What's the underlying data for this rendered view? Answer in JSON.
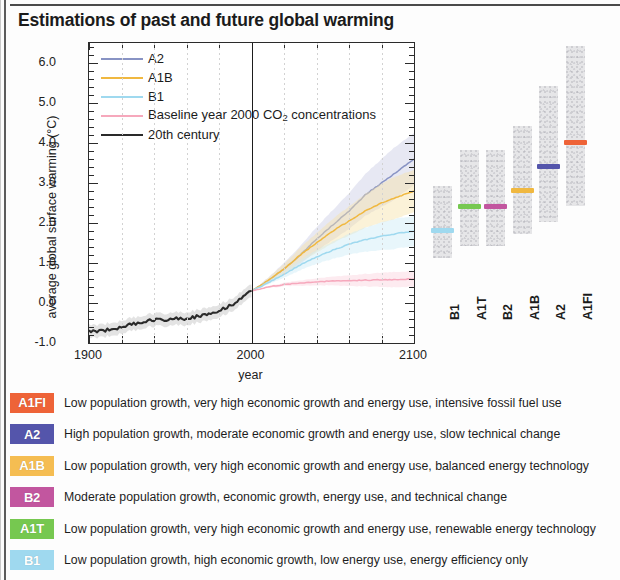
{
  "title": "Estimations of past and future global warming",
  "chart_data": {
    "type": "line",
    "title": "Estimations of past and future global warming",
    "xlabel": "year",
    "ylabel": "average global surface warming (°C)",
    "xlim": [
      1900,
      2100
    ],
    "ylim": [
      -1.0,
      6.5
    ],
    "xticks": [
      1900,
      2000,
      2100
    ],
    "xtick_minor_step": 20,
    "yticks": [
      -1.0,
      0.0,
      1.0,
      2.0,
      3.0,
      4.0,
      5.0,
      6.0
    ],
    "ytick_labels": [
      "-1.0",
      "0.0",
      "1.0",
      "2.0",
      "3.0",
      "4.0",
      "5.0",
      "6.0"
    ],
    "grid": "vertical-dashed",
    "legend_position": "top-left-inside",
    "reference_line_year": 2000,
    "series": [
      {
        "name": "A2",
        "color": "#8893c4",
        "band_color": "#c9cde4",
        "x": [
          2000,
          2010,
          2020,
          2030,
          2040,
          2050,
          2060,
          2070,
          2080,
          2090,
          2100
        ],
        "values": [
          0.3,
          0.55,
          0.85,
          1.2,
          1.6,
          1.95,
          2.3,
          2.7,
          3.0,
          3.3,
          3.6
        ],
        "end_value": 3.6
      },
      {
        "name": "A1B",
        "color": "#f0b840",
        "band_color": "#f7e3a8",
        "x": [
          2000,
          2010,
          2020,
          2030,
          2040,
          2050,
          2060,
          2070,
          2080,
          2090,
          2100
        ],
        "values": [
          0.3,
          0.55,
          0.85,
          1.2,
          1.5,
          1.8,
          2.05,
          2.3,
          2.5,
          2.65,
          2.8
        ],
        "end_value": 2.8
      },
      {
        "name": "B1",
        "color": "#9fd9ef",
        "band_color": "#cdeaf7",
        "x": [
          2000,
          2010,
          2020,
          2030,
          2040,
          2050,
          2060,
          2070,
          2080,
          2090,
          2100
        ],
        "values": [
          0.3,
          0.5,
          0.72,
          0.95,
          1.15,
          1.32,
          1.47,
          1.58,
          1.67,
          1.74,
          1.8
        ],
        "end_value": 1.8
      },
      {
        "name": "Baseline year 2000 CO2 concentrations",
        "label_html": "Baseline year 2000 CO<sub>2</sub> concentrations",
        "color": "#f6a8bc",
        "band_color": "#fbd3de",
        "x": [
          2000,
          2010,
          2020,
          2030,
          2040,
          2050,
          2060,
          2070,
          2080,
          2090,
          2100
        ],
        "values": [
          0.3,
          0.4,
          0.46,
          0.5,
          0.53,
          0.55,
          0.56,
          0.57,
          0.58,
          0.59,
          0.6
        ],
        "end_value": 0.6
      },
      {
        "name": "20th century",
        "color": "#2a2a2a",
        "band_color": "#cccccc",
        "x": [
          1900,
          1910,
          1920,
          1930,
          1940,
          1950,
          1960,
          1970,
          1980,
          1990,
          2000
        ],
        "values": [
          -0.72,
          -0.68,
          -0.6,
          -0.5,
          -0.42,
          -0.4,
          -0.38,
          -0.32,
          -0.18,
          0.0,
          0.3
        ],
        "end_value": 0.3
      }
    ],
    "bar_panel": {
      "description": "Projected warming ranges at 2090-2099 relative to 1980-1999",
      "categories": [
        "B1",
        "A1T",
        "B2",
        "A1B",
        "A2",
        "A1FI"
      ],
      "bars": [
        {
          "name": "B1",
          "low": 1.1,
          "high": 2.9,
          "best": 1.8,
          "marker_color": "#9fd9ef"
        },
        {
          "name": "A1T",
          "low": 1.4,
          "high": 3.8,
          "best": 2.4,
          "marker_color": "#76c850"
        },
        {
          "name": "B2",
          "low": 1.4,
          "high": 3.8,
          "best": 2.4,
          "marker_color": "#c2569f"
        },
        {
          "name": "A1B",
          "low": 1.7,
          "high": 4.4,
          "best": 2.8,
          "marker_color": "#f0b840"
        },
        {
          "name": "A2",
          "low": 2.0,
          "high": 5.4,
          "best": 3.4,
          "marker_color": "#5455ab"
        },
        {
          "name": "A1FI",
          "low": 2.4,
          "high": 6.4,
          "best": 4.0,
          "marker_color": "#ee6338"
        }
      ]
    }
  },
  "scenarios": [
    {
      "code": "A1FI",
      "color": "#ee6338",
      "description": "Low population growth, very high economic growth and energy use, intensive fossil fuel use"
    },
    {
      "code": "A2",
      "color": "#5455ab",
      "description": "High population growth, moderate economic growth and energy use, slow technical change"
    },
    {
      "code": "A1B",
      "color": "#f5bd52",
      "description": "Low population growth, very high economic growth and energy use, balanced energy technology"
    },
    {
      "code": "B2",
      "color": "#c2569f",
      "description": "Moderate population growth, economic growth, energy use, and technical change"
    },
    {
      "code": "A1T",
      "color": "#76c850",
      "description": "Low population growth, very high economic growth and energy use, renewable energy technology"
    },
    {
      "code": "B1",
      "color": "#9fd9ef",
      "description": "Low population growth, high economic growth, low energy use, energy efficiency only"
    }
  ]
}
